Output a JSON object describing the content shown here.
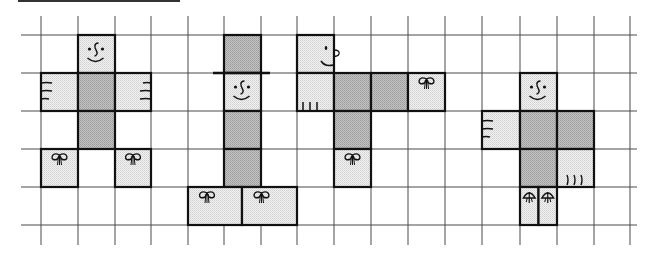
{
  "title_rule": {
    "x1": 18,
    "x2": 180,
    "y": 1
  },
  "grid": {
    "x_lines": [
      41,
      78,
      115,
      151,
      188,
      224,
      261,
      297,
      334,
      371,
      408,
      445,
      482,
      520,
      557,
      594,
      630
    ],
    "y_lines": [
      35,
      73,
      111,
      149,
      187,
      225
    ],
    "h_extent": [
      21,
      637
    ],
    "v_extent": [
      16,
      245
    ],
    "color": "#4a4a4a"
  },
  "colors": {
    "light_fill": "#e6e6e6",
    "dark_fill": "#b3b3b3",
    "outline": "#111111",
    "ink": "#111111"
  },
  "figures": [
    {
      "name": "figure-1-front-view",
      "cells": [
        {
          "part": "head",
          "x": 78,
          "y": 35,
          "w": 37,
          "h": 38,
          "fill": "light",
          "deco": "face-front"
        },
        {
          "part": "left-hand",
          "x": 41,
          "y": 73,
          "w": 37,
          "h": 38,
          "fill": "light",
          "deco": "fingers-left"
        },
        {
          "part": "torso",
          "x": 78,
          "y": 73,
          "w": 37,
          "h": 38,
          "fill": "dark"
        },
        {
          "part": "right-hand",
          "x": 115,
          "y": 73,
          "w": 36,
          "h": 38,
          "fill": "light",
          "deco": "fingers-right"
        },
        {
          "part": "legs",
          "x": 78,
          "y": 111,
          "w": 37,
          "h": 38,
          "fill": "dark"
        },
        {
          "part": "left-foot",
          "x": 41,
          "y": 149,
          "w": 37,
          "h": 38,
          "fill": "light",
          "deco": "bow"
        },
        {
          "part": "right-foot",
          "x": 115,
          "y": 149,
          "w": 36,
          "h": 38,
          "fill": "light",
          "deco": "bow"
        }
      ]
    },
    {
      "name": "figure-2-hat-figure",
      "cells": [
        {
          "part": "hat",
          "x": 224,
          "y": 35,
          "w": 37,
          "h": 38,
          "fill": "dark"
        },
        {
          "part": "head",
          "x": 224,
          "y": 73,
          "w": 37,
          "h": 38,
          "fill": "light",
          "deco": "face-front"
        },
        {
          "part": "torso",
          "x": 224,
          "y": 111,
          "w": 37,
          "h": 38,
          "fill": "dark"
        },
        {
          "part": "legs",
          "x": 224,
          "y": 149,
          "w": 37,
          "h": 38,
          "fill": "dark"
        },
        {
          "part": "left-foot",
          "x": 188,
          "y": 187,
          "w": 54,
          "h": 38,
          "fill": "light",
          "deco": "bow"
        },
        {
          "part": "right-foot",
          "x": 242,
          "y": 187,
          "w": 55,
          "h": 38,
          "fill": "light",
          "deco": "bow"
        }
      ],
      "hat_brim": {
        "x1": 213,
        "x2": 270,
        "y": 73
      }
    },
    {
      "name": "figure-3-profile-figure",
      "cells": [
        {
          "part": "head",
          "x": 297,
          "y": 35,
          "w": 37,
          "h": 38,
          "fill": "light",
          "deco": "face-profile"
        },
        {
          "part": "hand",
          "x": 297,
          "y": 73,
          "w": 37,
          "h": 38,
          "fill": "light",
          "deco": "fingers-bottom-straight"
        },
        {
          "part": "torso",
          "x": 334,
          "y": 73,
          "w": 37,
          "h": 38,
          "fill": "dark"
        },
        {
          "part": "torso-extension",
          "x": 371,
          "y": 73,
          "w": 37,
          "h": 38,
          "fill": "dark"
        },
        {
          "part": "foot-right",
          "x": 408,
          "y": 73,
          "w": 37,
          "h": 38,
          "fill": "light",
          "deco": "bow"
        },
        {
          "part": "legs",
          "x": 334,
          "y": 111,
          "w": 37,
          "h": 38,
          "fill": "dark"
        },
        {
          "part": "foot-bottom",
          "x": 334,
          "y": 149,
          "w": 37,
          "h": 38,
          "fill": "light",
          "deco": "bow"
        }
      ]
    },
    {
      "name": "figure-4-small-feet-figure",
      "cells": [
        {
          "part": "head",
          "x": 520,
          "y": 73,
          "w": 37,
          "h": 38,
          "fill": "light",
          "deco": "face-front"
        },
        {
          "part": "left-hand",
          "x": 482,
          "y": 111,
          "w": 38,
          "h": 38,
          "fill": "light",
          "deco": "fingers-left"
        },
        {
          "part": "torso",
          "x": 520,
          "y": 111,
          "w": 37,
          "h": 38,
          "fill": "dark"
        },
        {
          "part": "torso-extension",
          "x": 557,
          "y": 111,
          "w": 37,
          "h": 38,
          "fill": "dark"
        },
        {
          "part": "legs",
          "x": 520,
          "y": 149,
          "w": 37,
          "h": 38,
          "fill": "dark"
        },
        {
          "part": "right-hand",
          "x": 557,
          "y": 149,
          "w": 37,
          "h": 38,
          "fill": "light",
          "deco": "fingers-bottom-curved"
        },
        {
          "part": "left-foot",
          "x": 520,
          "y": 187,
          "w": 18.5,
          "h": 38,
          "fill": "light",
          "deco": "bow-small"
        },
        {
          "part": "right-foot",
          "x": 538.5,
          "y": 187,
          "w": 18.5,
          "h": 38,
          "fill": "light",
          "deco": "bow-small"
        }
      ]
    }
  ]
}
